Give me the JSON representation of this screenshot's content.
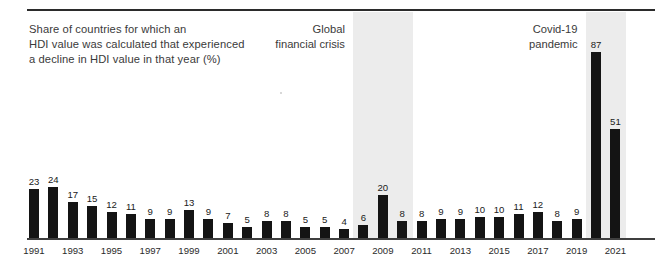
{
  "figure": {
    "title_lines": [
      "Share of countries for which an",
      "HDI value was calculated that experienced",
      "a decline in HDI value in that year (%)"
    ],
    "annotations": [
      {
        "name": "global-financial-crisis",
        "lines": [
          "Global",
          "financial crisis"
        ],
        "band_start_year": 2008,
        "band_end_year": 2010
      },
      {
        "name": "covid-19-pandemic",
        "lines": [
          "Covid-19",
          "pandemic"
        ],
        "band_start_year": 2020,
        "band_end_year": 2021
      }
    ],
    "colors": {
      "bar": "#141414",
      "band": "#ececec",
      "rule": "#2b2b2b",
      "text": "#3a3a3a",
      "background": "#ffffff"
    }
  },
  "chart_data": {
    "type": "bar",
    "title": "Share of countries for which an HDI value was calculated that experienced a decline in HDI value in that year (%)",
    "xlabel": "",
    "ylabel": "",
    "ylim": [
      0,
      92
    ],
    "grid": false,
    "legend": null,
    "categories": [
      "1991",
      "1992",
      "1993",
      "1994",
      "1995",
      "1996",
      "1997",
      "1998",
      "1999",
      "2000",
      "2001",
      "2002",
      "2003",
      "2004",
      "2005",
      "2006",
      "2007",
      "2008",
      "2009",
      "2010",
      "2011",
      "2012",
      "2013",
      "2014",
      "2015",
      "2016",
      "2017",
      "2018",
      "2019",
      "2020",
      "2021"
    ],
    "values": [
      23,
      24,
      17,
      15,
      12,
      11,
      9,
      9,
      13,
      9,
      7,
      5,
      8,
      8,
      5,
      5,
      4,
      6,
      20,
      8,
      8,
      9,
      9,
      10,
      10,
      11,
      12,
      8,
      9,
      87,
      51
    ],
    "tick_labels": [
      "1991",
      "1993",
      "1995",
      "1997",
      "1999",
      "2001",
      "2003",
      "2005",
      "2007",
      "2009",
      "2011",
      "2013",
      "2015",
      "2017",
      "2019",
      "2021"
    ],
    "annotations": [
      {
        "text": "Global financial crisis",
        "span": [
          "2008",
          "2010"
        ]
      },
      {
        "text": "Covid-19 pandemic",
        "span": [
          "2020",
          "2021"
        ]
      }
    ]
  }
}
